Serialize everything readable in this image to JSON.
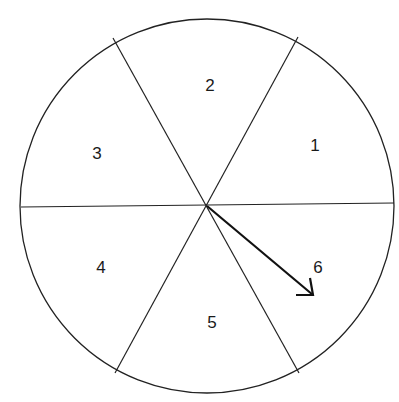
{
  "spinner": {
    "sections": [
      {
        "label": "1",
        "x": 315,
        "y": 151
      },
      {
        "label": "2",
        "x": 210,
        "y": 91
      },
      {
        "label": "3",
        "x": 97,
        "y": 159
      },
      {
        "label": "4",
        "x": 101,
        "y": 273
      },
      {
        "label": "5",
        "x": 212,
        "y": 328
      },
      {
        "label": "6",
        "x": 318,
        "y": 273
      }
    ],
    "pointer_points_to": "6",
    "colors": {
      "stroke": "#1a1a1a",
      "background": "#ffffff"
    }
  }
}
